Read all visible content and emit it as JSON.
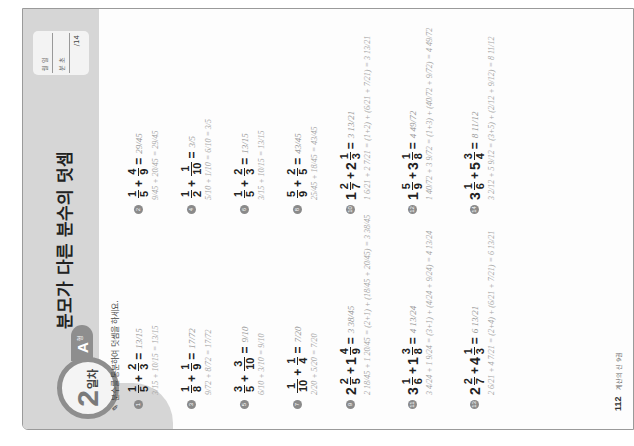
{
  "header": {
    "day_number": "2",
    "day_label": "일차",
    "type_letter": "A",
    "type_suffix": "형",
    "title": "분모가 다른 분수의 덧셈",
    "score_box": {
      "date_label": "월   일",
      "time_label": "분   초",
      "total": "/14"
    }
  },
  "instruction": "분수를 통분하여 덧셈을 하세요.",
  "problems": [
    {
      "num": "1",
      "whole_a": "",
      "a_n": "1",
      "a_d": "5",
      "whole_b": "",
      "b_n": "2",
      "b_d": "3",
      "answer": "13/15",
      "work": "3/15 + 10/15 = 13/15"
    },
    {
      "num": "2",
      "whole_a": "",
      "a_n": "1",
      "a_d": "5",
      "whole_b": "",
      "b_n": "4",
      "b_d": "9",
      "answer": "29/45",
      "work": "9/45 + 20/45 = 29/45"
    },
    {
      "num": "3",
      "whole_a": "",
      "a_n": "1",
      "a_d": "8",
      "whole_b": "",
      "b_n": "1",
      "b_d": "9",
      "answer": "17/72",
      "work": "9/72 + 8/72 = 17/72"
    },
    {
      "num": "4",
      "whole_a": "",
      "a_n": "1",
      "a_d": "2",
      "whole_b": "",
      "b_n": "1",
      "b_d": "10",
      "answer": "3/5",
      "work": "5/10 + 1/10 = 6/10 = 3/5"
    },
    {
      "num": "5",
      "whole_a": "",
      "a_n": "3",
      "a_d": "5",
      "whole_b": "",
      "b_n": "3",
      "b_d": "10",
      "answer": "9/10",
      "work": "6/10 + 3/10 = 9/10"
    },
    {
      "num": "6",
      "whole_a": "",
      "a_n": "1",
      "a_d": "5",
      "whole_b": "",
      "b_n": "2",
      "b_d": "3",
      "answer": "13/15",
      "work": "3/15 + 10/15 = 13/15"
    },
    {
      "num": "7",
      "whole_a": "",
      "a_n": "1",
      "a_d": "10",
      "whole_b": "",
      "b_n": "1",
      "b_d": "4",
      "answer": "7/20",
      "work": "2/20 + 5/20 = 7/20"
    },
    {
      "num": "8",
      "whole_a": "",
      "a_n": "5",
      "a_d": "9",
      "whole_b": "",
      "b_n": "2",
      "b_d": "5",
      "answer": "43/45",
      "work": "25/45 + 18/45 = 43/45"
    },
    {
      "num": "9",
      "whole_a": "2",
      "a_n": "2",
      "a_d": "5",
      "whole_b": "1",
      "b_n": "4",
      "b_d": "9",
      "answer": "3 38/45",
      "work": "2 18/45 + 1 20/45 = (2+1) + (18/45 + 20/45) = 3 38/45"
    },
    {
      "num": "10",
      "whole_a": "1",
      "a_n": "2",
      "a_d": "7",
      "whole_b": "2",
      "b_n": "1",
      "b_d": "3",
      "answer": "3 13/21",
      "work": "1 6/21 + 2 7/21 = (1+2) + (6/21 + 7/21) = 3 13/21"
    },
    {
      "num": "11",
      "whole_a": "3",
      "a_n": "1",
      "a_d": "6",
      "whole_b": "1",
      "b_n": "3",
      "b_d": "8",
      "answer": "4 13/24",
      "work": "3 4/24 + 1 9/24 = (3+1) + (4/24 + 9/24) = 4 13/24"
    },
    {
      "num": "12",
      "whole_a": "1",
      "a_n": "5",
      "a_d": "9",
      "whole_b": "3",
      "b_n": "1",
      "b_d": "8",
      "answer": "4 49/72",
      "work": "1 40/72 + 3 9/72 = (1+3) + (40/72 + 9/72) = 4 49/72"
    },
    {
      "num": "13",
      "whole_a": "2",
      "a_n": "2",
      "a_d": "7",
      "whole_b": "4",
      "b_n": "1",
      "b_d": "3",
      "answer": "6 13/21",
      "work": "2 6/21 + 4 7/21 = (2+4) + (6/21 + 7/21) = 6 13/21"
    },
    {
      "num": "14",
      "whole_a": "3",
      "a_n": "1",
      "a_d": "6",
      "whole_b": "5",
      "b_n": "3",
      "b_d": "4",
      "answer": "8 11/12",
      "work": "3 2/12 + 5 9/12 = (3+5) + (2/12 + 9/12) = 8 11/12"
    }
  ],
  "footer": {
    "page_number": "112",
    "book_title": "계산의 신 9권"
  }
}
